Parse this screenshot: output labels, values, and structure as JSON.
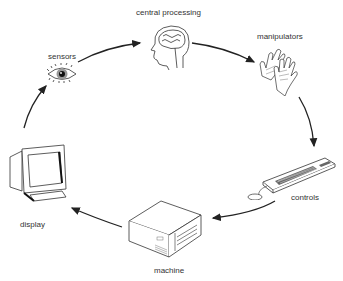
{
  "diagram": {
    "type": "cycle",
    "nodes": [
      {
        "id": "central_processing",
        "label": "central processing",
        "icon": "head-brain-icon"
      },
      {
        "id": "manipulators",
        "label": "manipulators",
        "icon": "hands-icon"
      },
      {
        "id": "controls",
        "label": "controls",
        "icon": "keyboard-mouse-icon"
      },
      {
        "id": "machine",
        "label": "machine",
        "icon": "computer-case-icon"
      },
      {
        "id": "display",
        "label": "display",
        "icon": "monitor-icon"
      },
      {
        "id": "sensors",
        "label": "sensors",
        "icon": "eye-icon"
      }
    ],
    "edges": [
      {
        "from": "sensors",
        "to": "central_processing"
      },
      {
        "from": "central_processing",
        "to": "manipulators"
      },
      {
        "from": "manipulators",
        "to": "controls"
      },
      {
        "from": "controls",
        "to": "machine"
      },
      {
        "from": "machine",
        "to": "display"
      },
      {
        "from": "display",
        "to": "sensors"
      }
    ],
    "colors": {
      "line": "#222222",
      "text": "#333333",
      "background": "#ffffff"
    }
  }
}
